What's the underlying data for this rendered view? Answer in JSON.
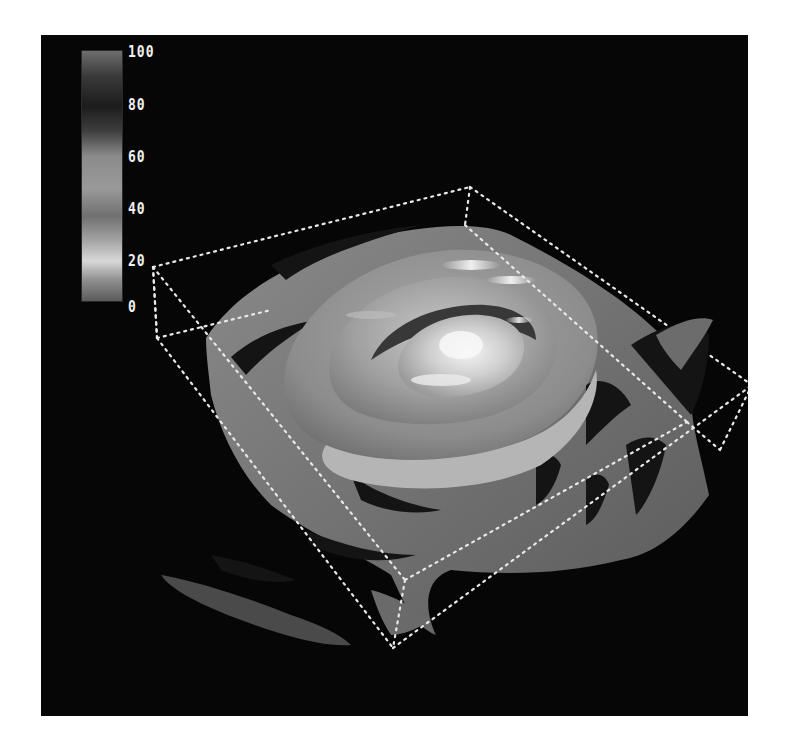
{
  "viewer": {
    "background": "#060606",
    "page_background": "#ffffff",
    "bounding_box_color": "#e8e8e8"
  },
  "colorbar": {
    "min": 0,
    "max": 100,
    "labels": [
      "100",
      "80",
      "60",
      "40",
      "20",
      "0"
    ],
    "gradient_stops": [
      {
        "pos": 0.0,
        "color": "#6e6e6e"
      },
      {
        "pos": 0.1,
        "color": "#3a3a3a"
      },
      {
        "pos": 0.22,
        "color": "#1c1c1c"
      },
      {
        "pos": 0.32,
        "color": "#3e3e3e"
      },
      {
        "pos": 0.42,
        "color": "#8a8a8a"
      },
      {
        "pos": 0.55,
        "color": "#9a9a9a"
      },
      {
        "pos": 0.66,
        "color": "#707070"
      },
      {
        "pos": 0.76,
        "color": "#a5a5a5"
      },
      {
        "pos": 0.84,
        "color": "#d8d8d8"
      },
      {
        "pos": 0.92,
        "color": "#8c8c8c"
      },
      {
        "pos": 1.0,
        "color": "#5a5a5a"
      }
    ]
  },
  "visualization": {
    "type": "3d-isosurface",
    "shell_count": 4
  }
}
